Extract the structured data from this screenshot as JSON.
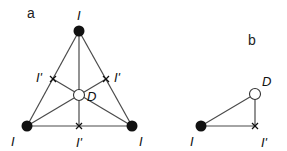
{
  "panels": {
    "a": {
      "label": "a",
      "vertices": [
        {
          "name": "top",
          "label": "I",
          "x": 79,
          "y": 31
        },
        {
          "name": "bottom-left",
          "label": "I",
          "x": 27,
          "y": 126
        },
        {
          "name": "bottom-right",
          "label": "I",
          "x": 132,
          "y": 126
        }
      ],
      "center": {
        "label": "D",
        "x": 79,
        "y": 95
      },
      "midpoints": [
        {
          "name": "left",
          "label": "I'",
          "x": 53,
          "y": 79
        },
        {
          "name": "right",
          "label": "I'",
          "x": 106,
          "y": 79
        },
        {
          "name": "bottom",
          "label": "I'",
          "x": 79,
          "y": 126
        }
      ]
    },
    "b": {
      "label": "b",
      "vertex": {
        "label": "I",
        "x": 201,
        "y": 126
      },
      "center": {
        "label": "D",
        "x": 255,
        "y": 94
      },
      "midpoint": {
        "label": "I'",
        "x": 255,
        "y": 126
      }
    }
  },
  "colors": {
    "line": "#4a4a4a",
    "filled_node": "#111111",
    "open_node": "#ffffff"
  }
}
